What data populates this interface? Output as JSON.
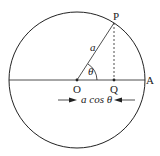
{
  "diagram": {
    "title": "",
    "points": {
      "P": "P",
      "O": "O",
      "Q": "Q",
      "A": "A"
    },
    "labels": {
      "radius": "a",
      "angle": "θ",
      "projection": "a cos θ"
    },
    "colors": {
      "stroke": "#222222",
      "background": "#ffffff"
    }
  }
}
